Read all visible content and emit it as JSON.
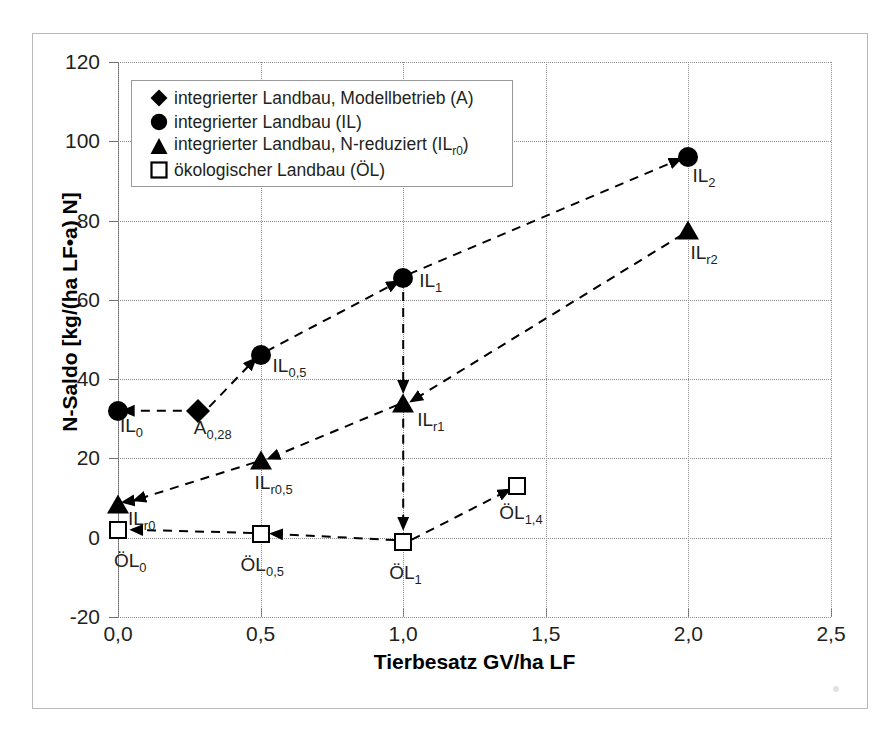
{
  "figure": {
    "background": "#ffffff",
    "frame_color": "#b9b9b9"
  },
  "axes": {
    "y_title": "N-Saldo [kg/(ha LF•a) N]",
    "x_title": "Tierbesatz GV/ha LF",
    "y_ticks": [
      "120",
      "100",
      "80",
      "60",
      "40",
      "20",
      "0",
      "-20"
    ],
    "x_ticks": [
      "0,0",
      "0,5",
      "1,0",
      "1,5",
      "2,0",
      "2,5"
    ]
  },
  "legend": {
    "items": [
      {
        "symbol": "diamond",
        "label": "integrierter Landbau, Modellbetrieb (A)"
      },
      {
        "symbol": "circle",
        "label": "integrierter Landbau (IL)"
      },
      {
        "symbol": "triangle",
        "label": "integrierter Landbau, N-reduziert (IL",
        "label_sub": "r0",
        "label_end": ")"
      },
      {
        "symbol": "square",
        "label": "ökologischer Landbau (ÖL)"
      }
    ]
  },
  "chart_data": {
    "type": "scatter",
    "title": "",
    "xlabel": "Tierbesatz GV/ha LF",
    "ylabel": "N-Saldo [kg/(ha LF•a) N]",
    "xlim": [
      0.0,
      2.5
    ],
    "ylim": [
      -20,
      120
    ],
    "xtick_step": 0.5,
    "ytick_step": 20,
    "grid": "horizontal-and-vertical-dotted",
    "legend_position": "top-left-inside",
    "series": [
      {
        "name": "integrierter Landbau, Modellbetrieb (A)",
        "symbol": "diamond",
        "points": [
          {
            "label": "A",
            "label_sub": "0,28",
            "x": 0.28,
            "y": 32
          }
        ]
      },
      {
        "name": "integrierter Landbau (IL)",
        "symbol": "circle",
        "points": [
          {
            "label": "IL",
            "label_sub": "0",
            "x": 0.0,
            "y": 32
          },
          {
            "label": "IL",
            "label_sub": "0,5",
            "x": 0.5,
            "y": 46
          },
          {
            "label": "IL",
            "label_sub": "1",
            "x": 1.0,
            "y": 65.5
          },
          {
            "label": "IL",
            "label_sub": "2",
            "x": 2.0,
            "y": 96
          }
        ]
      },
      {
        "name": "integrierter Landbau, N-reduziert (ILr0)",
        "symbol": "triangle",
        "points": [
          {
            "label": "IL",
            "label_sub": "r0",
            "x": 0.0,
            "y": 8.5
          },
          {
            "label": "IL",
            "label_sub": "r0,5",
            "x": 0.5,
            "y": 19.5
          },
          {
            "label": "IL",
            "label_sub": "r1",
            "x": 1.0,
            "y": 34
          },
          {
            "label": "IL",
            "label_sub": "r2",
            "x": 2.0,
            "y": 77.5
          }
        ]
      },
      {
        "name": "ökologischer Landbau (ÖL)",
        "symbol": "square",
        "points": [
          {
            "label": "ÖL",
            "label_sub": "0",
            "x": 0.0,
            "y": 2
          },
          {
            "label": "ÖL",
            "label_sub": "0,5",
            "x": 0.5,
            "y": 1
          },
          {
            "label": "ÖL",
            "label_sub": "1",
            "x": 1.0,
            "y": -1
          },
          {
            "label": "ÖL",
            "label_sub": "1,4",
            "x": 1.4,
            "y": 13
          }
        ]
      }
    ],
    "connectors": [
      {
        "from": [
          0.28,
          32
        ],
        "to": [
          0.02,
          32
        ],
        "note": "A0,28 to IL0"
      },
      {
        "from": [
          0.32,
          33
        ],
        "to": [
          0.48,
          45
        ],
        "note": "A0,28 to IL0,5"
      },
      {
        "from": [
          0.52,
          47
        ],
        "to": [
          0.98,
          64.5
        ],
        "note": "IL0,5 to IL1"
      },
      {
        "from": [
          1.02,
          66.5
        ],
        "to": [
          1.97,
          95.5
        ],
        "note": "IL1 to IL2"
      },
      {
        "from": [
          0.07,
          9.5
        ],
        "to": [
          0.02,
          9
        ],
        "note": "to ILr0"
      },
      {
        "from": [
          0.48,
          19
        ],
        "to": [
          0.06,
          9.5
        ],
        "note": "ILr0,5 to ILr0"
      },
      {
        "from": [
          0.98,
          33.5
        ],
        "to": [
          0.53,
          20
        ],
        "note": "ILr1 to ILr0,5"
      },
      {
        "from": [
          1.98,
          76.5
        ],
        "to": [
          1.03,
          34.5
        ],
        "note": "ILr2 to ILr1"
      },
      {
        "from": [
          1.0,
          62
        ],
        "to": [
          1.0,
          37
        ],
        "note": "IL1 down to ILr1"
      },
      {
        "from": [
          1.0,
          30
        ],
        "to": [
          1.0,
          2.5
        ],
        "note": "ILr1 down to OL1"
      },
      {
        "from": [
          0.47,
          1.2
        ],
        "to": [
          0.05,
          2.0
        ],
        "note": "OL0,5 to OL0"
      },
      {
        "from": [
          0.97,
          -0.6
        ],
        "to": [
          0.54,
          1.0
        ],
        "note": "OL1 to OL0,5"
      },
      {
        "from": [
          1.03,
          -0.5
        ],
        "to": [
          1.37,
          12
        ],
        "note": "OL1 to OL1,4"
      }
    ]
  },
  "point_labels": {
    "IL0": {
      "text": "IL",
      "sub": "0"
    },
    "A028": {
      "text": "A",
      "sub": "0,28"
    },
    "IL05": {
      "text": "IL",
      "sub": "0,5"
    },
    "IL1": {
      "text": "IL",
      "sub": "1"
    },
    "IL2": {
      "text": "IL",
      "sub": "2"
    },
    "ILr0": {
      "text": "IL",
      "sub": "r0"
    },
    "ILr05": {
      "text": "IL",
      "sub": "r0,5"
    },
    "ILr1": {
      "text": "IL",
      "sub": "r1"
    },
    "ILr2": {
      "text": "IL",
      "sub": "r2"
    },
    "OL0": {
      "text": "ÖL",
      "sub": "0"
    },
    "OL05": {
      "text": "ÖL",
      "sub": "0,5"
    },
    "OL1": {
      "text": "ÖL",
      "sub": "1"
    },
    "OL14": {
      "text": "ÖL",
      "sub": "1,4"
    }
  }
}
